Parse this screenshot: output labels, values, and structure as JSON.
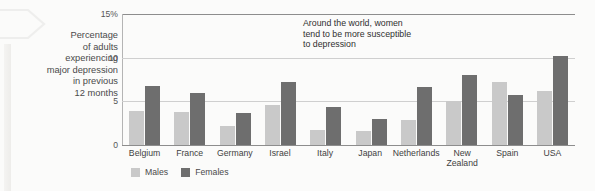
{
  "caption": {
    "text": "Percentage\nof adults\nexperiencing\nmajor depression\nin previous\n12 months"
  },
  "annotation": {
    "text": "Around the world, women\ntend to be more susceptible\nto depression"
  },
  "legend": {
    "items": [
      {
        "label": "Males",
        "color": "#c9c9c9",
        "swatch": "males-swatch"
      },
      {
        "label": "Females",
        "color": "#6e6e6e",
        "swatch": "females-swatch"
      }
    ]
  },
  "axis": {
    "y_ticks": [
      "15%",
      "10",
      "5",
      "0"
    ]
  },
  "chart_data": {
    "type": "bar",
    "title": "",
    "subtitle": "",
    "xlabel": "",
    "ylabel": "Percentage of adults experiencing major depression in previous 12 months",
    "ylim": [
      0,
      15
    ],
    "yticks": [
      0,
      5,
      10,
      15
    ],
    "grid": true,
    "legend_position": "bottom-left",
    "annotations": [
      "Around the world, women tend to be more susceptible to depression"
    ],
    "categories": [
      "Belgium",
      "France",
      "Germany",
      "Israel",
      "Italy",
      "Japan",
      "Netherlands",
      "New Zealand",
      "Spain",
      "USA"
    ],
    "series": [
      {
        "name": "Males",
        "color": "#c9c9c9",
        "values": [
          3.9,
          3.8,
          2.2,
          4.6,
          1.7,
          1.6,
          2.9,
          5.0,
          7.2,
          6.2
        ]
      },
      {
        "name": "Females",
        "color": "#6e6e6e",
        "values": [
          6.8,
          5.9,
          3.7,
          7.2,
          4.3,
          3.0,
          6.6,
          8.0,
          5.7,
          10.2
        ]
      }
    ]
  }
}
